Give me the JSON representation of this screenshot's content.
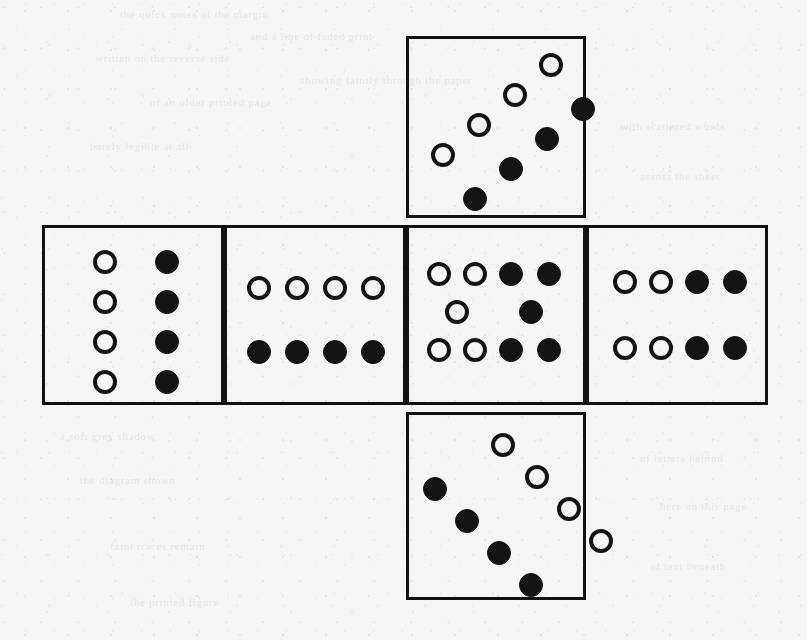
{
  "page": {
    "background_color": "#f5f5f3",
    "ink_color": "#141414",
    "width": 807,
    "height": 640
  },
  "ghost_text": [
    {
      "text": "the  quick  notes  of  the  margin",
      "x": 120,
      "y": 8
    },
    {
      "text": "and  a  line  of  faded  print",
      "x": 250,
      "y": 30
    },
    {
      "text": "written  on  the  reverse  side",
      "x": 95,
      "y": 52
    },
    {
      "text": "showing  faintly  through  the  paper",
      "x": 300,
      "y": 74
    },
    {
      "text": "of  an  older  printed  page",
      "x": 150,
      "y": 96
    },
    {
      "text": "with  scattered  words",
      "x": 620,
      "y": 120
    },
    {
      "text": "barely  legible  at  all",
      "x": 90,
      "y": 140
    },
    {
      "text": "across  the  sheet",
      "x": 640,
      "y": 170
    },
    {
      "text": "a  soft  grey  shadow",
      "x": 60,
      "y": 430
    },
    {
      "text": "of  letters  behind",
      "x": 640,
      "y": 452
    },
    {
      "text": "the  diagram  shown",
      "x": 80,
      "y": 474
    },
    {
      "text": "here  on  this  page",
      "x": 660,
      "y": 500
    },
    {
      "text": "faint  traces  remain",
      "x": 110,
      "y": 540
    },
    {
      "text": "of  text  beneath",
      "x": 650,
      "y": 560
    },
    {
      "text": "the  printed  figure",
      "x": 130,
      "y": 596
    }
  ],
  "net": {
    "layout": "latin-cross",
    "face_size": {
      "width": 182,
      "height": 182
    },
    "pip_diameter": 24,
    "faces": [
      {
        "id": "top",
        "name": "face-top",
        "position": {
          "x": 406,
          "y": 36,
          "width": 180,
          "height": 182
        },
        "pattern": "double-diagonal",
        "pip_count": 8,
        "white_count": 4,
        "black_count": 4,
        "pips": [
          {
            "color": "white",
            "x": 22,
            "y": 104
          },
          {
            "color": "white",
            "x": 58,
            "y": 74
          },
          {
            "color": "white",
            "x": 94,
            "y": 44
          },
          {
            "color": "white",
            "x": 130,
            "y": 14
          },
          {
            "color": "black",
            "x": 54,
            "y": 148
          },
          {
            "color": "black",
            "x": 90,
            "y": 118
          },
          {
            "color": "black",
            "x": 126,
            "y": 88
          },
          {
            "color": "black",
            "x": 162,
            "y": 58
          }
        ]
      },
      {
        "id": "left",
        "name": "face-left",
        "position": {
          "x": 42,
          "y": 225,
          "width": 182,
          "height": 180
        },
        "pattern": "two-columns",
        "pip_count": 8,
        "white_count": 4,
        "black_count": 4,
        "pips": [
          {
            "color": "white",
            "x": 48,
            "y": 22
          },
          {
            "color": "white",
            "x": 48,
            "y": 62
          },
          {
            "color": "white",
            "x": 48,
            "y": 102
          },
          {
            "color": "white",
            "x": 48,
            "y": 142
          },
          {
            "color": "black",
            "x": 110,
            "y": 22
          },
          {
            "color": "black",
            "x": 110,
            "y": 62
          },
          {
            "color": "black",
            "x": 110,
            "y": 102
          },
          {
            "color": "black",
            "x": 110,
            "y": 142
          }
        ]
      },
      {
        "id": "front-left",
        "name": "face-front-left",
        "position": {
          "x": 224,
          "y": 225,
          "width": 182,
          "height": 180
        },
        "pattern": "two-rows",
        "pip_count": 8,
        "white_count": 4,
        "black_count": 4,
        "pips": [
          {
            "color": "white",
            "x": 20,
            "y": 48
          },
          {
            "color": "white",
            "x": 58,
            "y": 48
          },
          {
            "color": "white",
            "x": 96,
            "y": 48
          },
          {
            "color": "white",
            "x": 134,
            "y": 48
          },
          {
            "color": "black",
            "x": 20,
            "y": 112
          },
          {
            "color": "black",
            "x": 58,
            "y": 112
          },
          {
            "color": "black",
            "x": 96,
            "y": 112
          },
          {
            "color": "black",
            "x": 134,
            "y": 112
          }
        ]
      },
      {
        "id": "center",
        "name": "face-center",
        "position": {
          "x": 406,
          "y": 225,
          "width": 180,
          "height": 180
        },
        "pattern": "three-rows-staggered",
        "pip_count": 10,
        "white_count": 5,
        "black_count": 5,
        "pips": [
          {
            "color": "white",
            "x": 18,
            "y": 34
          },
          {
            "color": "white",
            "x": 54,
            "y": 34
          },
          {
            "color": "black",
            "x": 90,
            "y": 34
          },
          {
            "color": "black",
            "x": 128,
            "y": 34
          },
          {
            "color": "white",
            "x": 36,
            "y": 72
          },
          {
            "color": "black",
            "x": 110,
            "y": 72
          },
          {
            "color": "white",
            "x": 18,
            "y": 110
          },
          {
            "color": "white",
            "x": 54,
            "y": 110
          },
          {
            "color": "black",
            "x": 90,
            "y": 110
          },
          {
            "color": "black",
            "x": 128,
            "y": 110
          }
        ]
      },
      {
        "id": "right",
        "name": "face-right",
        "position": {
          "x": 586,
          "y": 225,
          "width": 182,
          "height": 180
        },
        "pattern": "two-rows",
        "pip_count": 8,
        "white_count": 4,
        "black_count": 4,
        "pips": [
          {
            "color": "white",
            "x": 24,
            "y": 42
          },
          {
            "color": "white",
            "x": 60,
            "y": 42
          },
          {
            "color": "black",
            "x": 96,
            "y": 42
          },
          {
            "color": "black",
            "x": 134,
            "y": 42
          },
          {
            "color": "white",
            "x": 24,
            "y": 108
          },
          {
            "color": "white",
            "x": 60,
            "y": 108
          },
          {
            "color": "black",
            "x": 96,
            "y": 108
          },
          {
            "color": "black",
            "x": 134,
            "y": 108
          }
        ]
      },
      {
        "id": "bottom",
        "name": "face-bottom",
        "position": {
          "x": 406,
          "y": 412,
          "width": 180,
          "height": 188
        },
        "pattern": "double-diagonal",
        "pip_count": 8,
        "white_count": 4,
        "black_count": 4,
        "pips": [
          {
            "color": "white",
            "x": 82,
            "y": 18
          },
          {
            "color": "white",
            "x": 116,
            "y": 50
          },
          {
            "color": "white",
            "x": 148,
            "y": 82
          },
          {
            "color": "white",
            "x": 180,
            "y": 114
          },
          {
            "color": "black",
            "x": 14,
            "y": 62
          },
          {
            "color": "black",
            "x": 46,
            "y": 94
          },
          {
            "color": "black",
            "x": 78,
            "y": 126
          },
          {
            "color": "black",
            "x": 110,
            "y": 158
          }
        ]
      }
    ]
  }
}
